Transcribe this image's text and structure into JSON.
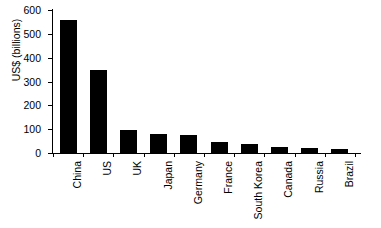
{
  "chart_data": {
    "type": "bar",
    "title": "",
    "subtitle": "",
    "xlabel": "",
    "ylabel": "US$ (billions)",
    "categories": [
      "China",
      "US",
      "UK",
      "Japan",
      "Germany",
      "France",
      "South Korea",
      "Canada",
      "Russia",
      "Brazil"
    ],
    "values": [
      560,
      348,
      95,
      80,
      77,
      45,
      37,
      27,
      19,
      17
    ],
    "series": [
      {
        "name": "US$ (billions)",
        "values": [
          560,
          348,
          95,
          80,
          77,
          45,
          37,
          27,
          19,
          17
        ]
      }
    ],
    "ylim": [
      0,
      600
    ],
    "yticks": [
      0,
      100,
      200,
      300,
      400,
      500,
      600
    ],
    "ytick_labels": [
      "0",
      "100",
      "200",
      "300",
      "400",
      "500",
      "600"
    ],
    "grid": false,
    "legend": false,
    "legend_position": "none",
    "bar_color": "#000000",
    "axis_color": "#000000",
    "background_color": "#ffffff",
    "annotations": []
  }
}
